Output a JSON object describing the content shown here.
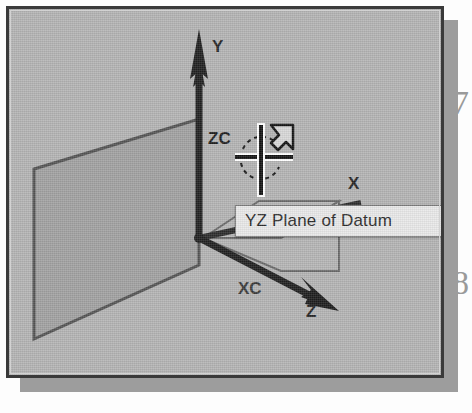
{
  "figure": {
    "kind": "cad-viewport-screenshot",
    "background_color": "#b4b4b4",
    "frame_color": "#3a3a3a"
  },
  "tooltip": {
    "text": "YZ Plane of Datum",
    "background_color": "#e9e9e9",
    "border_color": "#7d7d7d",
    "text_color": "#2b2b2b"
  },
  "axes": {
    "y_label": "Y",
    "x_label": "X",
    "z_label": "Z"
  },
  "wcs": {
    "zc_label": "ZC",
    "xc_label": "XC"
  },
  "cursor": {
    "type": "crosshair-with-pointer",
    "color": "#1a1a1a"
  },
  "planes": {
    "yz_plane_name": "YZ Plane of Datum",
    "yz_fill_color": "#a0a0a0",
    "xz_fill_color": "#bdbdbd",
    "edge_color": "#5a5a5a"
  },
  "page_bleed": {
    "top_glyph": "7",
    "bottom_glyph": "8"
  }
}
